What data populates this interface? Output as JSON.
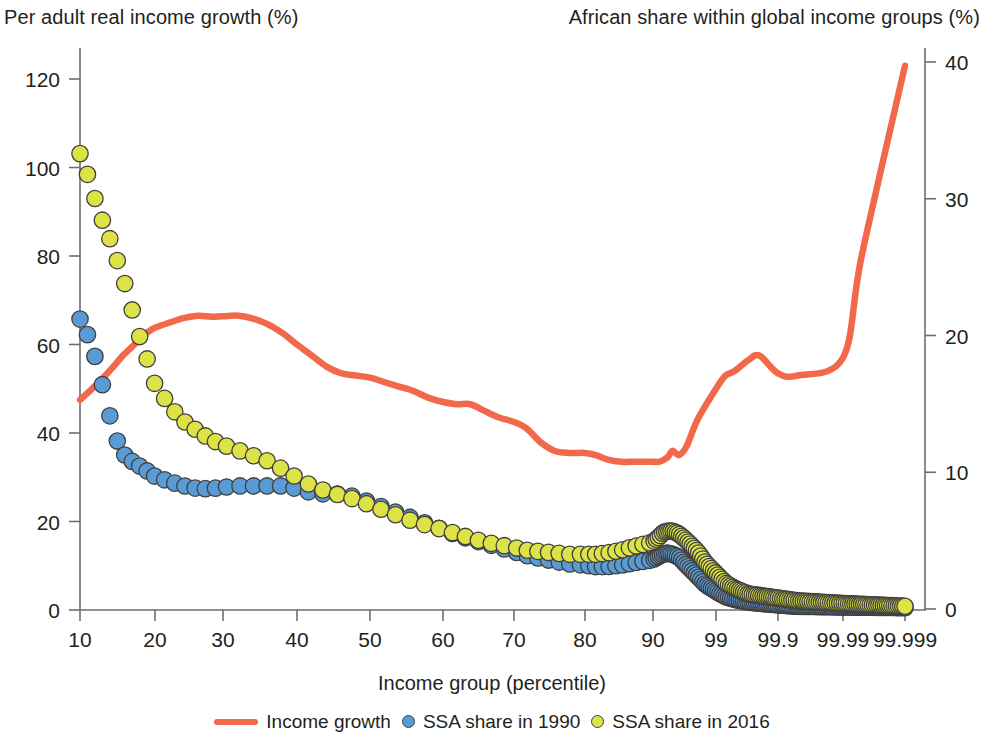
{
  "titles": {
    "left_axis": "Per adult real income growth (%)",
    "right_axis": "African share within global income groups (%)",
    "x_axis": "Income group (percentile)"
  },
  "legend": {
    "items": [
      {
        "label": "Income growth",
        "marker": "line",
        "color": "#f1684a"
      },
      {
        "label": "SSA share in 1990",
        "marker": "dot",
        "color": "#5b9bd5"
      },
      {
        "label": "SSA share in 2016",
        "marker": "dot",
        "color": "#dde346"
      }
    ]
  },
  "colors": {
    "income_growth_line": "#f1684a",
    "ssa_1990_dot": "#5b9bd5",
    "ssa_2016_dot": "#dde346",
    "dot_outline": "#3f3f3f",
    "axis": "#6d6e71",
    "text": "#231f20"
  },
  "chart_data": {
    "type": "line",
    "title": "",
    "xlabel": "Income group (percentile)",
    "ylabel": "Per adult real income growth (%)",
    "y2label": "African share within global income groups (%)",
    "grid": false,
    "legend_position": "bottom",
    "x_scale": "log-odds (percentile)",
    "x_tick_labels": [
      "10",
      "20",
      "30",
      "40",
      "50",
      "60",
      "70",
      "80",
      "90",
      "99",
      "99.9",
      "99.99",
      "99.999"
    ],
    "x_tick_values": [
      10,
      20,
      30,
      40,
      50,
      60,
      70,
      80,
      90,
      99,
      99.9,
      99.99,
      99.999
    ],
    "x_tick_px": [
      80,
      155,
      223,
      297,
      370,
      443,
      514,
      585,
      653,
      716,
      778,
      843,
      905
    ],
    "ylim": [
      0,
      130
    ],
    "y_tick_labels": [
      "0",
      "20",
      "40",
      "60",
      "80",
      "100",
      "120"
    ],
    "y_tick_values": [
      0,
      20,
      40,
      60,
      80,
      100,
      120
    ],
    "y2lim": [
      0,
      43
    ],
    "y2_tick_labels": [
      "0",
      "10",
      "20",
      "30",
      "40"
    ],
    "y2_tick_values": [
      0,
      10,
      20,
      30,
      40
    ],
    "series": [
      {
        "name": "Income growth",
        "axis": "left",
        "type": "line",
        "color": "#f1684a",
        "x": [
          10,
          11,
          12,
          13,
          14,
          15,
          16,
          17,
          18,
          19,
          20,
          22,
          24,
          26,
          28,
          30,
          32,
          34,
          36,
          38,
          40,
          42,
          44,
          46,
          48,
          50,
          52,
          54,
          56,
          58,
          60,
          62,
          64,
          66,
          68,
          70,
          72,
          74,
          76,
          78,
          80,
          82,
          84,
          86,
          88,
          90,
          92,
          94,
          95,
          96,
          97,
          98,
          99,
          99.3,
          99.5,
          99.7,
          99.8,
          99.9,
          99.95,
          99.99,
          99.995,
          99.999
        ],
        "values": [
          47.5,
          49.5,
          51.5,
          53.5,
          55.5,
          57.5,
          59,
          60.5,
          62,
          63,
          63.8,
          65,
          66,
          66.5,
          66.3,
          66.4,
          66.5,
          65.8,
          64.5,
          62.5,
          60,
          57.5,
          55,
          53.5,
          53,
          52.5,
          51.5,
          50.5,
          49.5,
          48,
          47,
          46.5,
          46.5,
          45,
          43.5,
          42.5,
          41,
          38,
          36,
          35.5,
          35.5,
          35,
          34,
          33.5,
          33.5,
          33.5,
          33.5,
          34.5,
          36,
          35,
          37,
          43,
          50,
          53,
          54,
          56.5,
          57.5,
          53.5,
          53,
          57,
          80,
          123
        ],
        "note": "Left axis, %"
      },
      {
        "name": "SSA share in 1990",
        "axis": "right",
        "type": "scatter",
        "color": "#5b9bd5",
        "x": [
          10,
          11,
          12,
          13,
          14,
          15,
          16,
          17,
          18,
          19,
          20,
          22,
          24,
          26,
          28,
          30,
          32,
          34,
          36,
          38,
          40,
          42,
          44,
          46,
          48,
          50,
          52,
          54,
          56,
          58,
          60,
          62,
          64,
          66,
          68,
          70,
          72,
          74,
          76,
          78,
          80,
          82,
          84,
          86,
          88,
          90,
          92,
          93,
          94,
          95,
          96,
          97,
          98,
          98.5,
          99,
          99.3,
          99.5,
          99.7,
          99.9,
          99.95,
          99.99,
          99.999
        ],
        "values": [
          21.2,
          19.7,
          17.5,
          14.8,
          12.6,
          11.4,
          10.9,
          10.6,
          10.3,
          10.0,
          9.7,
          9.3,
          9.0,
          8.8,
          8.8,
          8.9,
          9.0,
          9.0,
          9.0,
          9.0,
          8.8,
          8.5,
          8.4,
          8.4,
          8.2,
          7.8,
          7.4,
          7.0,
          6.6,
          6.2,
          5.8,
          5.4,
          5.1,
          4.8,
          4.5,
          4.2,
          3.9,
          3.7,
          3.5,
          3.3,
          3.2,
          3.1,
          3.1,
          3.2,
          3.4,
          3.6,
          3.9,
          4.0,
          4.1,
          4.0,
          3.8,
          3.2,
          2.4,
          1.8,
          1.3,
          0.9,
          0.7,
          0.5,
          0.3,
          0.2,
          0.15,
          0.1
        ],
        "note": "Right axis, %"
      },
      {
        "name": "SSA share in 2016",
        "axis": "right",
        "type": "scatter",
        "color": "#dde346",
        "x": [
          10,
          11,
          12,
          13,
          14,
          15,
          16,
          17,
          18,
          19,
          20,
          21,
          22,
          23,
          24,
          26,
          28,
          30,
          32,
          34,
          36,
          38,
          40,
          42,
          44,
          46,
          48,
          50,
          52,
          54,
          56,
          58,
          60,
          62,
          64,
          66,
          68,
          70,
          72,
          74,
          76,
          78,
          80,
          82,
          84,
          86,
          88,
          90,
          92,
          93,
          94,
          95,
          96,
          97,
          98,
          98.5,
          99,
          99.3,
          99.5,
          99.7,
          99.9,
          99.95,
          99.99,
          99.999
        ],
        "values": [
          33.3,
          31.3,
          29.0,
          27.6,
          25.9,
          24.3,
          22.5,
          20.7,
          19.1,
          17.9,
          16.4,
          15.6,
          14.8,
          14.2,
          13.7,
          13.0,
          12.4,
          12.0,
          11.6,
          11.2,
          10.8,
          10.2,
          9.6,
          9.0,
          8.6,
          8.3,
          8.0,
          7.6,
          7.2,
          6.8,
          6.4,
          6.1,
          5.8,
          5.5,
          5.2,
          4.9,
          4.7,
          4.5,
          4.3,
          4.2,
          4.1,
          4.0,
          4.0,
          4.0,
          4.1,
          4.3,
          4.6,
          4.9,
          5.3,
          5.6,
          5.7,
          5.7,
          5.5,
          5.0,
          4.2,
          3.4,
          2.6,
          1.9,
          1.5,
          1.1,
          0.8,
          0.6,
          0.4,
          0.2
        ],
        "note": "Right axis, %"
      }
    ]
  }
}
